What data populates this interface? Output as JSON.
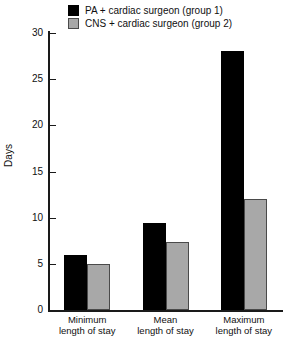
{
  "chart_data": {
    "type": "bar",
    "title": "",
    "subtitle": "",
    "xlabel": "",
    "ylabel": "Days",
    "categories": [
      "Minimum\nlength of stay",
      "Mean\nlength of stay",
      "Maximum\nlength of stay"
    ],
    "category_lines": [
      [
        "Minimum",
        "length of stay"
      ],
      [
        "Mean",
        "length of stay"
      ],
      [
        "Maximum",
        "length of stay"
      ]
    ],
    "series": [
      {
        "name": "PA + cardiac surgeon (group 1)",
        "color": "#000000",
        "values": [
          6,
          9.4,
          28
        ]
      },
      {
        "name": "CNS + cardiac surgeon (group 2)",
        "color": "#a8a8a8",
        "values": [
          5,
          7.4,
          12
        ]
      }
    ],
    "ylim": [
      0,
      30
    ],
    "yticks": [
      0,
      5,
      10,
      15,
      20,
      25,
      30
    ],
    "ytick_labels": [
      "0",
      "5",
      "10",
      "15",
      "20",
      "25",
      "30"
    ],
    "grid": false,
    "legend_position": "top-center",
    "axis_color": "#1a1a1a"
  },
  "legend": {
    "items": [
      {
        "label": "PA + cardiac surgeon (group 1)",
        "swatch": "black-square-swatch"
      },
      {
        "label": "CNS + cardiac surgeon (group 2)",
        "swatch": "gray-square-swatch"
      }
    ]
  },
  "caption": {
    "text": ""
  }
}
